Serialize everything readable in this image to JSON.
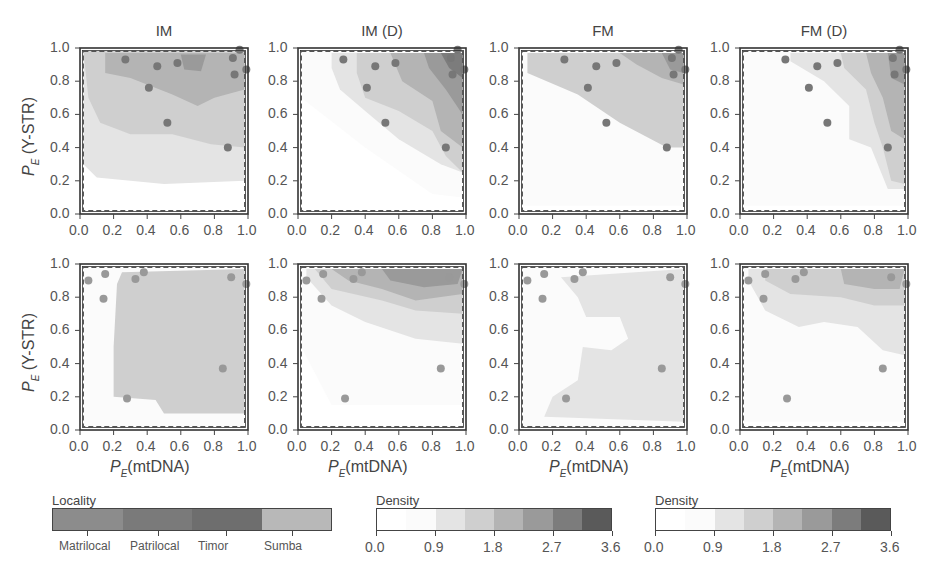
{
  "chart_data": {
    "type": "heatmap",
    "layout": "2x4 grid of density contour plots with scatter points",
    "columns": [
      "IM",
      "IM (D)",
      "FM",
      "FM (D)"
    ],
    "xlabel": "P_E (mtDNA)",
    "ylabel": "P_E (Y-STR)",
    "xlim": [
      0.0,
      1.0
    ],
    "ylim": [
      0.0,
      1.0
    ],
    "xticks": [
      "0.0",
      "0.2",
      "0.4",
      "0.6",
      "0.8",
      "1.0"
    ],
    "yticks": [
      "0.0",
      "0.2",
      "0.4",
      "0.6",
      "0.8",
      "1.0"
    ],
    "rows": [
      {
        "name": "row1",
        "points": [
          {
            "x": 0.27,
            "y": 0.93
          },
          {
            "x": 0.46,
            "y": 0.89
          },
          {
            "x": 0.58,
            "y": 0.91
          },
          {
            "x": 0.41,
            "y": 0.76
          },
          {
            "x": 0.52,
            "y": 0.55
          },
          {
            "x": 0.88,
            "y": 0.4
          },
          {
            "x": 0.91,
            "y": 0.94
          },
          {
            "x": 0.92,
            "y": 0.84
          },
          {
            "x": 0.99,
            "y": 0.87
          },
          {
            "x": 0.95,
            "y": 0.99
          }
        ],
        "point_color": "#777777"
      },
      {
        "name": "row2",
        "points": [
          {
            "x": 0.05,
            "y": 0.9
          },
          {
            "x": 0.15,
            "y": 0.94
          },
          {
            "x": 0.14,
            "y": 0.79
          },
          {
            "x": 0.33,
            "y": 0.91
          },
          {
            "x": 0.38,
            "y": 0.95
          },
          {
            "x": 0.9,
            "y": 0.92
          },
          {
            "x": 0.99,
            "y": 0.88
          },
          {
            "x": 0.85,
            "y": 0.37
          },
          {
            "x": 0.28,
            "y": 0.19
          }
        ],
        "point_color": "#999999"
      }
    ],
    "legends": [
      {
        "title": "Locality",
        "type": "categorical",
        "labels": [
          "Matrilocal",
          "Patrilocal",
          "Timor",
          "Sumba"
        ],
        "colors": [
          "#8c8c8c",
          "#7a7a7a",
          "#6e6e6e",
          "#b8b8b8"
        ]
      },
      {
        "title": "Density",
        "type": "continuous",
        "range": [
          0.0,
          3.6
        ],
        "ticks": [
          "0.0",
          "0.9",
          "1.8",
          "2.7",
          "3.6"
        ],
        "bins": 8
      },
      {
        "title": "Density",
        "type": "continuous",
        "range": [
          0.0,
          3.6
        ],
        "ticks": [
          "0.0",
          "0.9",
          "1.8",
          "2.7",
          "3.6"
        ],
        "bins": 8
      }
    ],
    "density_colors": [
      "#ffffff",
      "#fbfbfb",
      "#e4e4e4",
      "#cfcfcf",
      "#b4b4b4",
      "#9a9a9a",
      "#7c7c7c",
      "#5a5a5a"
    ],
    "dashed_frame": {
      "x0": 0.02,
      "x1": 0.98,
      "y0": 0.02,
      "y1": 0.98
    }
  },
  "panels": {
    "titles": [
      "IM",
      "IM (D)",
      "FM",
      "FM (D)"
    ]
  },
  "axis": {
    "x_main": "P",
    "x_sub": "E",
    "x_rest": "(mtDNA)",
    "y_main": "P",
    "y_sub": "E",
    "y_rest": " (Y-STR)"
  },
  "legend": {
    "locality_title": "Locality",
    "locality_labels": [
      "Matrilocal",
      "Patrilocal",
      "Timor",
      "Sumba"
    ],
    "density_title": "Density",
    "density_ticks": [
      "0.0",
      "0.9",
      "1.8",
      "2.7",
      "3.6"
    ]
  }
}
